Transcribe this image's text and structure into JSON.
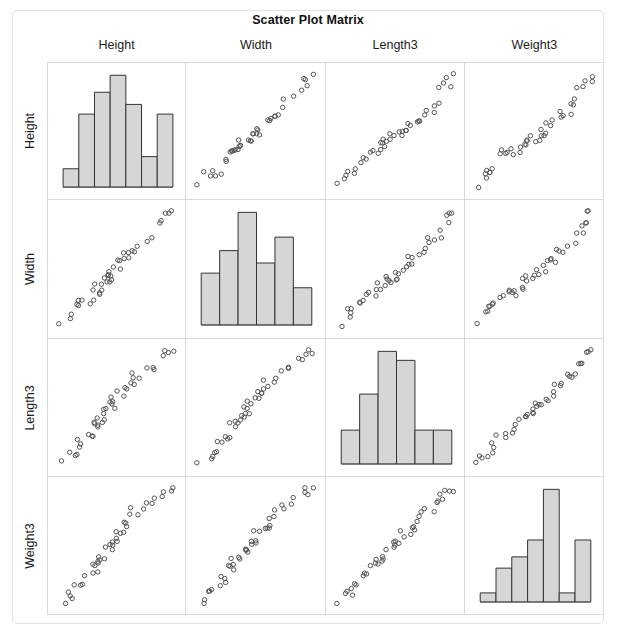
{
  "chart_data": {
    "type": "scatter",
    "title": "Scatter Plot Matrix",
    "layout": "4x4 scatter plot matrix (pairs plot); diagonal cells show histograms of each variable, off-diagonal cells show scatter plots of the column variable (x) against the row variable (y)",
    "variables": [
      "Height",
      "Width",
      "Length3",
      "Weight3"
    ],
    "column_headers": [
      "Height",
      "Width",
      "Length3",
      "Weight3"
    ],
    "row_labels": [
      "Height",
      "Width",
      "Length3",
      "Weight3"
    ],
    "grid": false,
    "legend": "none",
    "axis_tick_labels": "none",
    "marker": {
      "shape": "open-circle",
      "size_px": 4,
      "edge_color": "#555555",
      "fill": "none"
    },
    "bar_style": {
      "fill": "#d6d6d6",
      "edge_color": "#333333"
    },
    "histograms": [
      {
        "variable": "Height",
        "bins": 7,
        "counts": [
          0.15,
          0.6,
          0.78,
          0.92,
          0.68,
          0.25,
          0.6
        ]
      },
      {
        "variable": "Width",
        "bins": 6,
        "counts": [
          0.46,
          0.66,
          1.0,
          0.55,
          0.78,
          0.33
        ]
      },
      {
        "variable": "Length3",
        "bins": 6,
        "counts": [
          0.3,
          0.62,
          1.0,
          0.92,
          0.3,
          0.3
        ]
      },
      {
        "variable": "Weight3",
        "bins": 7,
        "counts": [
          0.08,
          0.3,
          0.4,
          0.55,
          1.0,
          0.08,
          0.55
        ]
      }
    ],
    "points": {
      "Height": [
        0.04,
        0.12,
        0.13,
        0.14,
        0.16,
        0.17,
        0.2,
        0.27,
        0.3,
        0.31,
        0.32,
        0.33,
        0.34,
        0.35,
        0.36,
        0.38,
        0.4,
        0.42,
        0.43,
        0.44,
        0.45,
        0.46,
        0.47,
        0.48,
        0.5,
        0.52,
        0.54,
        0.56,
        0.58,
        0.6,
        0.62,
        0.64,
        0.66,
        0.7,
        0.74,
        0.78,
        0.84,
        0.88,
        0.92,
        0.95,
        0.97
      ],
      "Width": [
        0.03,
        0.1,
        0.14,
        0.15,
        0.17,
        0.2,
        0.22,
        0.24,
        0.25,
        0.28,
        0.3,
        0.32,
        0.33,
        0.34,
        0.35,
        0.37,
        0.38,
        0.4,
        0.41,
        0.43,
        0.45,
        0.46,
        0.47,
        0.49,
        0.51,
        0.53,
        0.55,
        0.57,
        0.59,
        0.61,
        0.63,
        0.66,
        0.68,
        0.72,
        0.76,
        0.8,
        0.86,
        0.9,
        0.93,
        0.96,
        0.98
      ],
      "Length3": [
        0.03,
        0.08,
        0.1,
        0.12,
        0.15,
        0.18,
        0.21,
        0.24,
        0.27,
        0.29,
        0.31,
        0.33,
        0.35,
        0.37,
        0.39,
        0.41,
        0.43,
        0.45,
        0.47,
        0.49,
        0.5,
        0.52,
        0.54,
        0.56,
        0.58,
        0.6,
        0.62,
        0.64,
        0.67,
        0.69,
        0.71,
        0.74,
        0.76,
        0.79,
        0.82,
        0.85,
        0.88,
        0.91,
        0.94,
        0.96,
        0.99
      ],
      "Weight3": [
        0.02,
        0.06,
        0.09,
        0.11,
        0.13,
        0.15,
        0.18,
        0.22,
        0.26,
        0.29,
        0.31,
        0.33,
        0.35,
        0.37,
        0.39,
        0.41,
        0.43,
        0.45,
        0.47,
        0.48,
        0.5,
        0.52,
        0.55,
        0.57,
        0.59,
        0.61,
        0.63,
        0.66,
        0.68,
        0.7,
        0.73,
        0.76,
        0.79,
        0.82,
        0.85,
        0.88,
        0.9,
        0.93,
        0.95,
        0.97,
        0.99
      ]
    }
  },
  "chart": {
    "title": "Scatter Plot Matrix",
    "column_headers": [
      {
        "label": "Height"
      },
      {
        "label": "Width"
      },
      {
        "label": "Length3"
      },
      {
        "label": "Weight3"
      }
    ],
    "row_labels": [
      {
        "label": "Height"
      },
      {
        "label": "Width"
      },
      {
        "label": "Length3"
      },
      {
        "label": "Weight3"
      }
    ]
  }
}
